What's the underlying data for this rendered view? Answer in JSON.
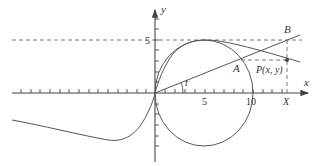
{
  "figure": {
    "colors": {
      "background": "#ffffff",
      "line": "#555555",
      "dashed": "#666666",
      "text": "#333333"
    }
  },
  "axes": {
    "x_label": "x",
    "y_label": "y",
    "x_tick_labels": [
      {
        "value": "5",
        "x": 205
      },
      {
        "value": "10",
        "x": 253
      }
    ],
    "y_tick_labels": [
      {
        "value": "5",
        "y": 40
      }
    ],
    "x_marker_label": "X"
  },
  "points": {
    "A": {
      "label": "A"
    },
    "B": {
      "label": "B"
    },
    "P": {
      "label": "P(x, y)"
    }
  },
  "angle_label": "t",
  "curves": {
    "circle": {
      "center": [
        5,
        0
      ],
      "radius": 5
    },
    "witch": "y = 1000/(x² + 100)-style curve through origin",
    "dashed_horizontal": "y = 5"
  }
}
